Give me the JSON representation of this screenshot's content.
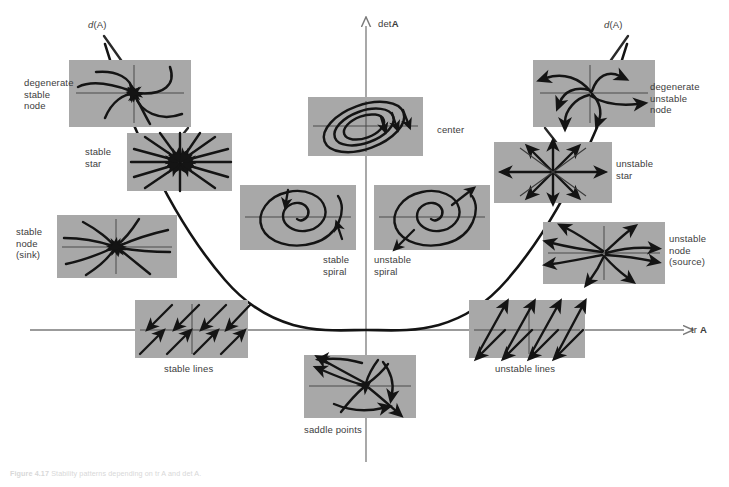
{
  "figure": {
    "background": "#ffffff",
    "panel_fill": "#a8a8a8",
    "stroke": "#1a1a1a",
    "axis_color": "#7a7a7a",
    "text_color": "#3c3c3c"
  },
  "axes": {
    "vertical_label_plain": "det",
    "vertical_label_bold": "A",
    "horizontal_label_plain": "tr ",
    "horizontal_label_bold": "A",
    "discriminant_label_italic": "d",
    "discriminant_label_rest": "(A)",
    "origin": {
      "x": 366,
      "y": 330
    },
    "vertical_top": 22,
    "vertical_bottom": 462,
    "horizontal_left": 30,
    "horizontal_right": 690
  },
  "labels": {
    "degenerate_stable_node": "degenerate\nstable\nnode",
    "degenerate_unstable_node": "degenerate\nunstable\nnode",
    "stable_star": "stable\nstar",
    "unstable_star": "unstable\nstar",
    "stable_node_sink": "stable\nnode\n(sink)",
    "unstable_node_source": "unstable\nnode\n(source)",
    "center": "center",
    "stable_spiral": "stable\nspiral",
    "unstable_spiral": "unstable\nspiral",
    "stable_lines": "stable lines",
    "unstable_lines": "unstable lines",
    "saddle_points": "saddle points"
  },
  "panels": [
    {
      "name": "degenerate-stable-node",
      "x": 69,
      "y": 60,
      "w": 122,
      "h": 67
    },
    {
      "name": "stable-star",
      "x": 127,
      "y": 133,
      "w": 105,
      "h": 58
    },
    {
      "name": "stable-node-sink",
      "x": 57,
      "y": 215,
      "w": 120,
      "h": 63
    },
    {
      "name": "center",
      "x": 308,
      "y": 97,
      "w": 115,
      "h": 59
    },
    {
      "name": "stable-spiral",
      "x": 240,
      "y": 185,
      "w": 116,
      "h": 65
    },
    {
      "name": "unstable-spiral",
      "x": 374,
      "y": 185,
      "w": 116,
      "h": 65
    },
    {
      "name": "degenerate-unstable-node",
      "x": 533,
      "y": 60,
      "w": 122,
      "h": 67
    },
    {
      "name": "unstable-star",
      "x": 494,
      "y": 142,
      "w": 118,
      "h": 61
    },
    {
      "name": "unstable-node-source",
      "x": 543,
      "y": 222,
      "w": 122,
      "h": 62
    },
    {
      "name": "stable-lines",
      "x": 135,
      "y": 300,
      "w": 113,
      "h": 58
    },
    {
      "name": "unstable-lines",
      "x": 469,
      "y": 300,
      "w": 116,
      "h": 58
    },
    {
      "name": "saddle-points",
      "x": 304,
      "y": 355,
      "w": 112,
      "h": 63
    }
  ],
  "caption": {
    "prefix": "Figure 4.17",
    "text": "Stability patterns depending on tr A and det A."
  }
}
